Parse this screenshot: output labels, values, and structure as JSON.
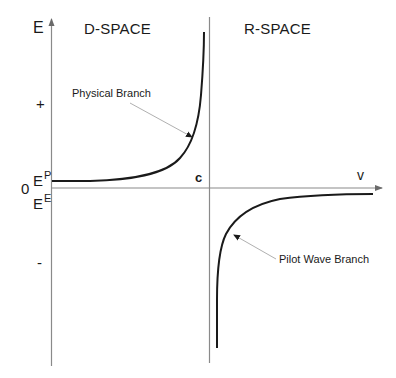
{
  "figure": {
    "type": "diagram",
    "regions": {
      "left": "D-SPACE",
      "right": "R-SPACE"
    },
    "axes": {
      "y_label": "E",
      "x_label": "v",
      "origin_label": "0",
      "c_label": "c",
      "plus_label": "+",
      "minus_label": "-",
      "ep_label": "E",
      "ep_sup": "P",
      "ee_label": "E",
      "ee_sup": "E"
    },
    "annotations": {
      "physical_branch": "Physical Branch",
      "pilot_wave_branch": "Pilot Wave Branch"
    },
    "colors": {
      "axis": "#8a8a8a",
      "curve": "#1a1a1a",
      "arrow": "#b0b0b0",
      "text": "#1a1a1a"
    }
  }
}
